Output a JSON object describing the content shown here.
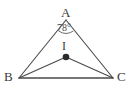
{
  "figure": {
    "type": "geometry-diagram",
    "background_color": "#ffffff",
    "stroke_color": "#4a4a4a",
    "labels": {
      "vertex_a": "A",
      "vertex_b": "B",
      "vertex_c": "C",
      "point_i": "I",
      "angle_a": "78°"
    },
    "points": {
      "A": {
        "x": 66,
        "y": 20
      },
      "B": {
        "x": 19,
        "y": 78
      },
      "C": {
        "x": 113,
        "y": 78
      },
      "I": {
        "x": 66,
        "y": 57
      }
    },
    "segments": [
      {
        "name": "AB",
        "from": "A",
        "to": "B"
      },
      {
        "name": "AC",
        "from": "A",
        "to": "C"
      },
      {
        "name": "BC",
        "from": "B",
        "to": "C"
      },
      {
        "name": "IB",
        "from": "I",
        "to": "B"
      },
      {
        "name": "IC",
        "from": "I",
        "to": "C"
      }
    ],
    "angle_arc": {
      "at": "A",
      "value": "78°",
      "radius": 12
    },
    "marked_point": {
      "name": "I",
      "style": "filled-dot",
      "radius": 3.2
    }
  }
}
